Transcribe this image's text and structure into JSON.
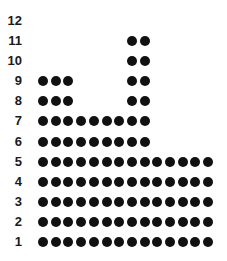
{
  "chart_data": {
    "type": "dot-plot",
    "title": "",
    "xlabel": "",
    "ylabel": "",
    "y_ticks": [
      1,
      2,
      3,
      4,
      5,
      6,
      7,
      8,
      9,
      10,
      11,
      12
    ],
    "rows": [
      {
        "y": 1,
        "columns": [
          0,
          1,
          2,
          3,
          4,
          5,
          6,
          7,
          8,
          9,
          10,
          11,
          12,
          13
        ],
        "count": 14
      },
      {
        "y": 2,
        "columns": [
          0,
          1,
          2,
          3,
          4,
          5,
          6,
          7,
          8,
          9,
          10,
          11,
          12,
          13
        ],
        "count": 14
      },
      {
        "y": 3,
        "columns": [
          0,
          1,
          2,
          3,
          4,
          5,
          6,
          7,
          8,
          9,
          10,
          11,
          12,
          13
        ],
        "count": 14
      },
      {
        "y": 4,
        "columns": [
          0,
          1,
          2,
          3,
          4,
          5,
          6,
          7,
          8,
          9,
          10,
          11,
          12,
          13
        ],
        "count": 14
      },
      {
        "y": 5,
        "columns": [
          0,
          1,
          2,
          3,
          4,
          5,
          6,
          7,
          8,
          9,
          10,
          11,
          12,
          13
        ],
        "count": 14
      },
      {
        "y": 6,
        "columns": [
          0,
          1,
          2,
          3,
          4,
          5,
          6,
          7,
          8
        ],
        "count": 9
      },
      {
        "y": 7,
        "columns": [
          0,
          1,
          2,
          3,
          4,
          5,
          6,
          7,
          8
        ],
        "count": 9
      },
      {
        "y": 8,
        "columns": [
          0,
          1,
          2,
          7,
          8
        ],
        "count": 5
      },
      {
        "y": 9,
        "columns": [
          0,
          1,
          2,
          7,
          8
        ],
        "count": 5
      },
      {
        "y": 10,
        "columns": [
          7,
          8
        ],
        "count": 2
      },
      {
        "y": 11,
        "columns": [
          7,
          8
        ],
        "count": 2
      },
      {
        "y": 12,
        "columns": [],
        "count": 0
      }
    ],
    "grid": false,
    "legend": null,
    "dot_color": "#111111"
  }
}
